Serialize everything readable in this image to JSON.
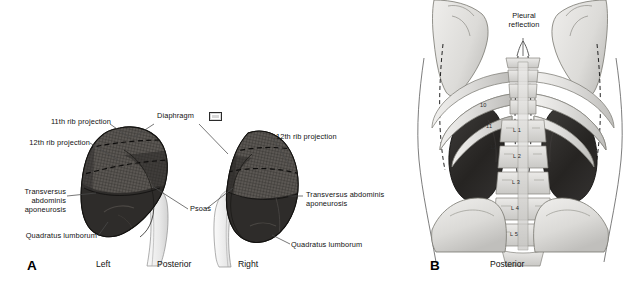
{
  "figure": {
    "background_color": "#ffffff",
    "width": 630,
    "height": 284
  },
  "panel_a": {
    "letter": "A",
    "orientation_labels": {
      "left": "Left",
      "center": "Posterior",
      "right": "Right"
    },
    "labels": {
      "rib11_left": "11th rib projection",
      "rib12_left": "12th rib projection",
      "transversus_left_line1": "Transversus",
      "transversus_left_line2": "abdominis",
      "transversus_left_line3": "aponeurosis",
      "quadratus_left": "Quadratus lumborum",
      "diaphragm": "Diaphragm",
      "psoas": "Psoas",
      "rib12_right": "12th rib projection",
      "transversus_right_line1": "Transversus abdominis",
      "transversus_right_line2": "aponeurosis",
      "quadratus_right": "Quadratus lumborum"
    },
    "colors": {
      "kidney_dark": "#33312f",
      "kidney_hatched": "#5b5753",
      "psoas_light": "#ededed",
      "leader_line": "#4a4a4a",
      "swatch_fill": "#d8d8d8",
      "swatch_border": "#2b2b2b"
    }
  },
  "panel_b": {
    "letter": "B",
    "orientation_labels": {
      "center": "Posterior"
    },
    "labels": {
      "pleural_line1": "Pleural",
      "pleural_line2": "reflection"
    },
    "rib_numbers": [
      "10",
      "11",
      "12"
    ],
    "vertebra_labels": [
      "L 1",
      "L 2",
      "L 3",
      "L 4",
      "L 5"
    ],
    "colors": {
      "kidney_dark": "#2f2d2b",
      "bone_light": "#dedddb",
      "bone_shade": "#c4c3c0",
      "body_outline": "#6b6b6b",
      "dashed_line": "#2a2a2a"
    }
  }
}
